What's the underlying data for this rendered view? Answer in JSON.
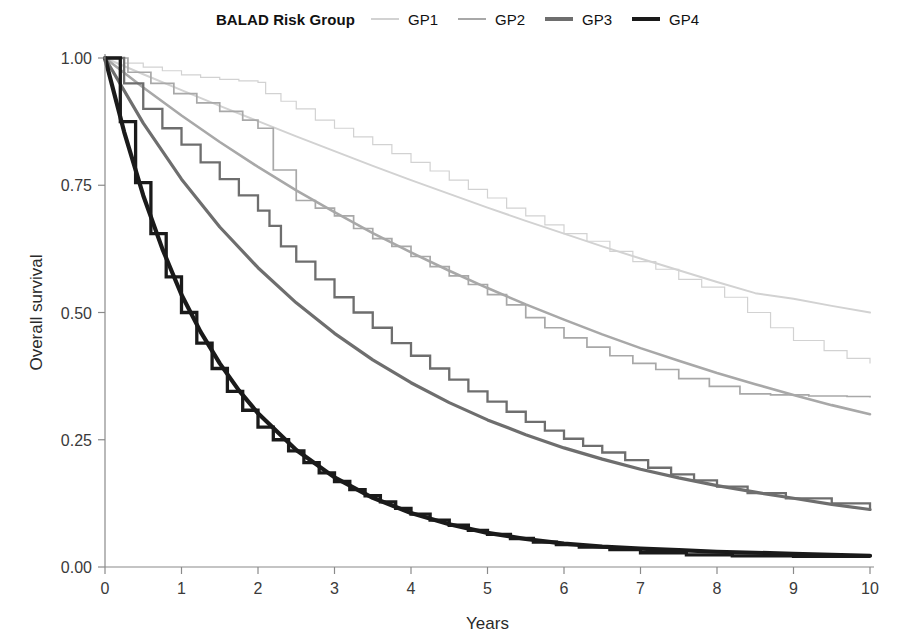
{
  "legend": {
    "title": "BALAD Risk Group",
    "entries": [
      {
        "label": "GP1",
        "color": "#d2d2d2",
        "width": 2.0
      },
      {
        "label": "GP2",
        "color": "#a8a8a8",
        "width": 2.6
      },
      {
        "label": "GP3",
        "color": "#6e6e6e",
        "width": 3.2
      },
      {
        "label": "GP4",
        "color": "#1a1a1a",
        "width": 4.2
      }
    ]
  },
  "axes": {
    "x_title": "Years",
    "y_title": "Overall survival",
    "x_ticks": [
      "0",
      "1",
      "2",
      "3",
      "4",
      "5",
      "6",
      "7",
      "8",
      "9",
      "10"
    ],
    "y_ticks": [
      "0.00",
      "0.25",
      "0.50",
      "0.75",
      "1.00"
    ]
  },
  "chart_data": {
    "type": "line",
    "title": "BALAD Risk Group",
    "xlabel": "Years",
    "ylabel": "Overall survival",
    "xlim": [
      0,
      10
    ],
    "ylim": [
      0,
      1
    ],
    "grid": false,
    "legend_position": "top",
    "x_ticks": [
      0,
      1,
      2,
      3,
      4,
      5,
      6,
      7,
      8,
      9,
      10
    ],
    "y_ticks": [
      0.0,
      0.25,
      0.5,
      0.75,
      1.0
    ],
    "note": "Each BALAD risk group is drawn twice: a smooth parametric (model) survival curve and a stepped Kaplan-Meier observed curve. Darker shades indicate worse prognosis.",
    "series": [
      {
        "name": "GP1",
        "style": "smooth",
        "color": "#d2d2d2",
        "x": [
          0,
          0.5,
          1,
          1.5,
          2,
          2.5,
          3,
          3.5,
          4,
          4.5,
          5,
          5.5,
          6,
          6.5,
          7,
          7.5,
          8,
          8.5,
          9,
          9.5,
          10
        ],
        "values": [
          1.0,
          0.968,
          0.937,
          0.906,
          0.876,
          0.846,
          0.817,
          0.788,
          0.76,
          0.733,
          0.706,
          0.68,
          0.655,
          0.63,
          0.606,
          0.583,
          0.56,
          0.538,
          0.527,
          0.513,
          0.5
        ]
      },
      {
        "name": "GP1",
        "style": "km-step",
        "color": "#d2d2d2",
        "x": [
          0,
          0.25,
          0.5,
          0.75,
          1.0,
          1.25,
          1.5,
          1.75,
          2.0,
          2.1,
          2.3,
          2.5,
          2.75,
          3.0,
          3.25,
          3.5,
          3.75,
          4.0,
          4.25,
          4.5,
          4.75,
          5.0,
          5.25,
          5.5,
          5.75,
          6.0,
          6.3,
          6.6,
          6.9,
          7.2,
          7.5,
          7.8,
          8.1,
          8.4,
          8.7,
          9.0,
          9.4,
          9.7,
          10.0
        ],
        "values": [
          1.0,
          0.99,
          0.982,
          0.975,
          0.967,
          0.962,
          0.958,
          0.955,
          0.952,
          0.93,
          0.915,
          0.9,
          0.878,
          0.862,
          0.845,
          0.83,
          0.812,
          0.795,
          0.778,
          0.76,
          0.742,
          0.725,
          0.705,
          0.69,
          0.672,
          0.655,
          0.64,
          0.62,
          0.6,
          0.585,
          0.565,
          0.55,
          0.53,
          0.5,
          0.47,
          0.445,
          0.425,
          0.41,
          0.4
        ]
      },
      {
        "name": "GP2",
        "style": "smooth",
        "color": "#a8a8a8",
        "x": [
          0,
          0.5,
          1,
          1.5,
          2,
          2.5,
          3,
          3.5,
          4,
          4.5,
          5,
          5.5,
          6,
          6.5,
          7,
          7.5,
          8,
          8.5,
          9,
          9.5,
          10
        ],
        "values": [
          1.0,
          0.942,
          0.887,
          0.835,
          0.786,
          0.74,
          0.697,
          0.656,
          0.618,
          0.582,
          0.548,
          0.516,
          0.486,
          0.457,
          0.43,
          0.405,
          0.381,
          0.359,
          0.338,
          0.318,
          0.3
        ]
      },
      {
        "name": "GP2",
        "style": "km-step",
        "color": "#a8a8a8",
        "x": [
          0,
          0.3,
          0.6,
          0.9,
          1.2,
          1.5,
          1.8,
          2.0,
          2.2,
          2.5,
          2.75,
          3.0,
          3.25,
          3.5,
          3.75,
          4.0,
          4.25,
          4.5,
          4.75,
          5.0,
          5.25,
          5.5,
          5.75,
          6.0,
          6.3,
          6.6,
          6.9,
          7.2,
          7.5,
          7.9,
          8.3,
          8.7,
          9.2,
          9.7,
          10.0
        ],
        "values": [
          1.0,
          0.972,
          0.95,
          0.93,
          0.912,
          0.895,
          0.878,
          0.862,
          0.78,
          0.72,
          0.705,
          0.69,
          0.665,
          0.645,
          0.63,
          0.61,
          0.59,
          0.572,
          0.555,
          0.535,
          0.515,
          0.49,
          0.47,
          0.45,
          0.432,
          0.415,
          0.4,
          0.388,
          0.37,
          0.355,
          0.34,
          0.338,
          0.336,
          0.335,
          0.333
        ]
      },
      {
        "name": "GP3",
        "style": "smooth",
        "color": "#6e6e6e",
        "x": [
          0,
          0.5,
          1,
          1.5,
          2,
          2.5,
          3,
          3.5,
          4,
          4.5,
          5,
          5.5,
          6,
          6.5,
          7,
          7.5,
          8,
          8.5,
          9,
          9.5,
          10
        ],
        "values": [
          1.0,
          0.872,
          0.762,
          0.668,
          0.588,
          0.519,
          0.459,
          0.407,
          0.362,
          0.323,
          0.289,
          0.26,
          0.234,
          0.212,
          0.192,
          0.175,
          0.16,
          0.147,
          0.135,
          0.123,
          0.113
        ]
      },
      {
        "name": "GP3",
        "style": "km-step",
        "color": "#6e6e6e",
        "x": [
          0,
          0.25,
          0.5,
          0.75,
          1.0,
          1.25,
          1.5,
          1.75,
          2.0,
          2.15,
          2.3,
          2.5,
          2.75,
          3.0,
          3.25,
          3.5,
          3.75,
          4.0,
          4.25,
          4.5,
          4.75,
          5.0,
          5.25,
          5.5,
          5.75,
          6.0,
          6.25,
          6.5,
          6.8,
          7.1,
          7.4,
          7.7,
          8.0,
          8.4,
          8.9,
          9.5,
          10.0
        ],
        "values": [
          1.0,
          0.95,
          0.9,
          0.862,
          0.83,
          0.795,
          0.762,
          0.73,
          0.7,
          0.67,
          0.63,
          0.6,
          0.565,
          0.53,
          0.5,
          0.47,
          0.44,
          0.415,
          0.39,
          0.368,
          0.345,
          0.325,
          0.305,
          0.285,
          0.268,
          0.252,
          0.238,
          0.225,
          0.21,
          0.195,
          0.182,
          0.17,
          0.158,
          0.145,
          0.135,
          0.125,
          0.11
        ]
      },
      {
        "name": "GP4",
        "style": "smooth",
        "color": "#1a1a1a",
        "x": [
          0,
          0.25,
          0.5,
          0.75,
          1.0,
          1.25,
          1.5,
          1.75,
          2.0,
          2.5,
          3.0,
          3.5,
          4.0,
          4.5,
          5.0,
          5.5,
          6.0,
          6.5,
          7.0,
          7.5,
          8.0,
          8.5,
          9.0,
          9.5,
          10.0
        ],
        "values": [
          1.0,
          0.855,
          0.73,
          0.625,
          0.535,
          0.462,
          0.4,
          0.347,
          0.302,
          0.23,
          0.176,
          0.136,
          0.106,
          0.084,
          0.067,
          0.055,
          0.046,
          0.04,
          0.036,
          0.033,
          0.03,
          0.028,
          0.026,
          0.024,
          0.022
        ]
      },
      {
        "name": "GP4",
        "style": "km-step",
        "color": "#1a1a1a",
        "x": [
          0,
          0.2,
          0.4,
          0.6,
          0.8,
          1.0,
          1.2,
          1.4,
          1.6,
          1.8,
          2.0,
          2.2,
          2.4,
          2.6,
          2.8,
          3.0,
          3.2,
          3.4,
          3.6,
          3.8,
          4.0,
          4.25,
          4.5,
          4.75,
          5.0,
          5.3,
          5.6,
          5.9,
          6.2,
          6.6,
          7.0,
          7.6,
          8.2,
          9.0,
          10.0
        ],
        "values": [
          1.0,
          0.875,
          0.755,
          0.655,
          0.57,
          0.5,
          0.44,
          0.39,
          0.345,
          0.308,
          0.275,
          0.25,
          0.228,
          0.205,
          0.185,
          0.168,
          0.152,
          0.14,
          0.128,
          0.115,
          0.104,
          0.092,
          0.082,
          0.072,
          0.064,
          0.056,
          0.049,
          0.044,
          0.039,
          0.034,
          0.028,
          0.024,
          0.022,
          0.021,
          0.02
        ]
      }
    ]
  }
}
